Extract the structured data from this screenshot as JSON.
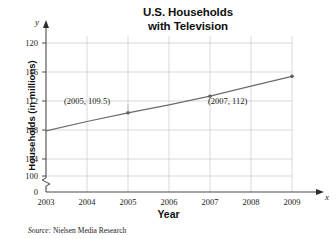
{
  "chart_data": {
    "type": "line",
    "title": "U.S. Households\nwith Television",
    "title_line1": "U.S. Households",
    "title_line2": "with Television",
    "xlabel": "Year",
    "ylabel": "Households (in millions)",
    "x_axis_variable": "x",
    "y_axis_variable": "y",
    "x": [
      2003,
      2004,
      2005,
      2006,
      2007,
      2008,
      2009
    ],
    "xtick_labels": [
      "2003",
      "2004",
      "2005",
      "2006",
      "2007",
      "2008",
      "2009"
    ],
    "ytick_labels": [
      "120",
      "116",
      "112",
      "108",
      "104",
      "100",
      "0"
    ],
    "ytick_values": [
      120,
      116,
      112,
      108,
      104,
      100,
      0
    ],
    "ylim": [
      100,
      122
    ],
    "xlim": [
      2003,
      2009
    ],
    "axis_break": true,
    "grid": true,
    "legend": null,
    "series": [
      {
        "name": "U.S. households with television",
        "values": [
          106.8,
          108.2,
          109.5,
          110.7,
          112.0,
          113.5,
          115.0
        ],
        "markers_shown_at": [
          2005,
          2007,
          2009
        ],
        "color": "#6b6b6b"
      }
    ],
    "annotations": [
      {
        "label": "(2005, 109.5)",
        "x": 2005,
        "y": 109.5
      },
      {
        "label": "(2007, 112)",
        "x": 2007,
        "y": 112
      }
    ],
    "source_prefix": "Source:",
    "source_text": "Nielsen Media Research"
  },
  "colors": {
    "line": "#6b6b6b",
    "grid": "#c8c8c8",
    "axis": "#5a5a5a",
    "text": "#1a1a1a",
    "background": "#ffffff"
  }
}
